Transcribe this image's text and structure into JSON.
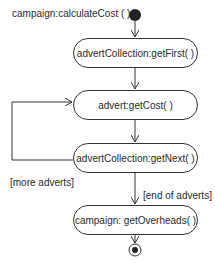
{
  "diagram": {
    "type": "UML activity diagram",
    "title": "campaign:calculateCost ( )",
    "nodes": [
      {
        "id": "start",
        "kind": "initial"
      },
      {
        "id": "getFirst",
        "kind": "action",
        "label": "advertCollection:getFirst( )"
      },
      {
        "id": "getCost",
        "kind": "action",
        "label": "advert:getCost( )"
      },
      {
        "id": "getNext",
        "kind": "action",
        "label": "advertCollection:getNext( )"
      },
      {
        "id": "getOverheads",
        "kind": "action",
        "label": "campaign: getOverheads( )"
      },
      {
        "id": "end",
        "kind": "final"
      }
    ],
    "edges": [
      {
        "from": "start",
        "to": "getFirst",
        "guard": ""
      },
      {
        "from": "getFirst",
        "to": "getCost",
        "guard": ""
      },
      {
        "from": "getCost",
        "to": "getNext",
        "guard": ""
      },
      {
        "from": "getNext",
        "to": "getCost",
        "guard": "[more adverts]"
      },
      {
        "from": "getNext",
        "to": "getOverheads",
        "guard": "[end of adverts]"
      },
      {
        "from": "getOverheads",
        "to": "end",
        "guard": ""
      }
    ],
    "colors": {
      "stroke": "#333333",
      "fill": "#ffffff",
      "text": "#2a2a2a"
    }
  }
}
